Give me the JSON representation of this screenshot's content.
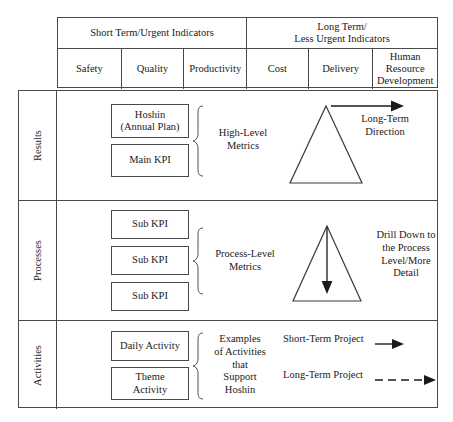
{
  "header": {
    "groups": [
      {
        "label": "Short Term/Urgent Indicators"
      },
      {
        "label": "Long Term/\nLess Urgent Indicators",
        "line1": "Long Term/",
        "line2": "Less Urgent Indicators"
      }
    ],
    "columns": [
      {
        "label": "Safety"
      },
      {
        "label": "Quality"
      },
      {
        "label": "Productivity"
      },
      {
        "label": "Cost"
      },
      {
        "label": "Delivery"
      },
      {
        "label": "Human Resource Development",
        "line1": "Human",
        "line2": "Resource",
        "line3": "Development"
      }
    ]
  },
  "rows": [
    {
      "label": "Results",
      "boxes": [
        {
          "line1": "Hoshin",
          "line2": "(Annual Plan)"
        },
        {
          "line1": "Main KPI"
        }
      ],
      "brace_label": {
        "line1": "High-Level",
        "line2": "Metrics"
      },
      "diagram_label": {
        "line1": "Long-Term",
        "line2": "Direction"
      },
      "arrow": "right-arrow-solid",
      "triangle": "triangle-outline"
    },
    {
      "label": "Processes",
      "boxes": [
        {
          "line1": "Sub KPI"
        },
        {
          "line1": "Sub KPI"
        },
        {
          "line1": "Sub KPI"
        }
      ],
      "brace_label": {
        "line1": "Process-Level",
        "line2": "Metrics"
      },
      "diagram_label": {
        "line1": "Drill Down to",
        "line2": "the Process",
        "line3": "Level/More",
        "line4": "Detail"
      },
      "arrow": "down-arrow-solid",
      "triangle": "triangle-outline"
    },
    {
      "label": "Activities",
      "boxes": [
        {
          "line1": "Daily Activity"
        },
        {
          "line1": "Theme",
          "line2": "Activity"
        }
      ],
      "brace_label": {
        "line1": "Examples",
        "line2": "of Activities",
        "line3": "that",
        "line4": "Support",
        "line5": "Hoshin"
      },
      "projects": [
        {
          "label": "Short-Term Project",
          "arrow": "short-solid-arrow"
        },
        {
          "label": "Long-Term Project",
          "arrow": "long-dashed-arrow"
        }
      ]
    }
  ],
  "colors": {
    "line": "#4a4a4a",
    "box_border": "#4a4a4a",
    "text": "#1a1a1a",
    "background": "#ffffff"
  }
}
